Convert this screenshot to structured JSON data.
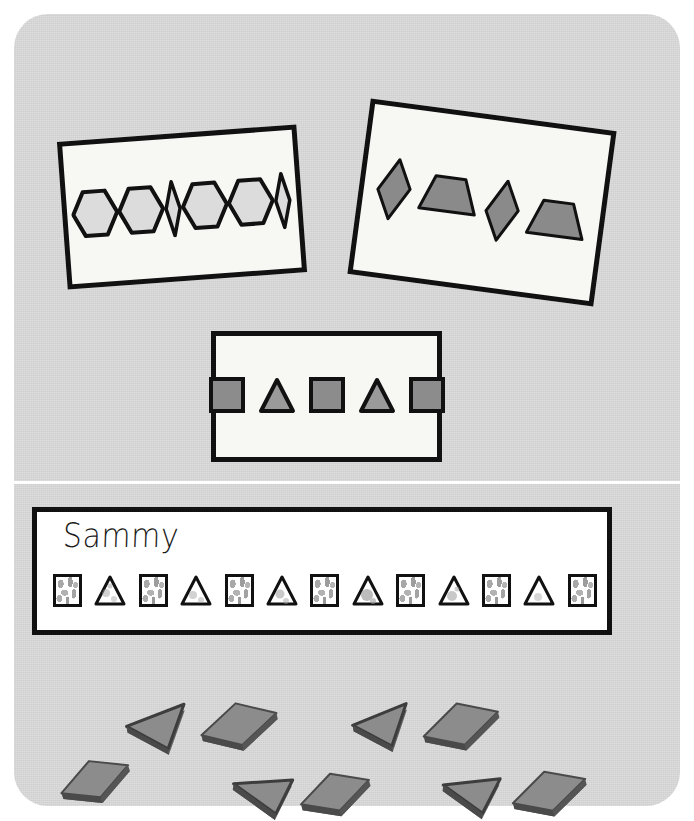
{
  "scene": {
    "title": "Pattern blocks worksheet scene",
    "board_color": "#d4d4d4",
    "card_fill": "#f7f7f4",
    "outline_color": "#111111",
    "block_fill": "#8c8c8c",
    "block_edge": "#5f5f5f"
  },
  "cards": [
    {
      "id": "card-hexagon-rhombus",
      "label": "Hexagon and slim rhombus pattern card",
      "rotation_deg": -4.2,
      "pattern_unit": "hexagon, hexagon, slim-rhombus",
      "shapes": [
        "hexagon",
        "hexagon",
        "slim-rhombus",
        "hexagon",
        "hexagon",
        "slim-rhombus"
      ],
      "shape_style": "outlined light grey"
    },
    {
      "id": "card-rhombus-trapezoid",
      "label": "Rhombus and trapezoid pattern card",
      "rotation_deg": 7.6,
      "pattern_unit": "rhombus, trapezoid",
      "shapes": [
        "rhombus",
        "trapezoid",
        "rhombus",
        "trapezoid"
      ],
      "shape_style": "solid grey fill"
    },
    {
      "id": "card-square-triangle",
      "label": "Square and triangle pattern card",
      "rotation_deg": 0,
      "pattern_unit": "square, triangle",
      "shapes": [
        "square",
        "triangle",
        "square",
        "triangle",
        "square"
      ],
      "shape_style": "solid grey fill"
    }
  ],
  "worksheet": {
    "name": "Sammy",
    "name_style": "handwritten",
    "pattern_unit": "square, triangle",
    "shapes": [
      "square",
      "triangle",
      "square",
      "triangle",
      "square",
      "triangle",
      "square",
      "triangle",
      "square",
      "triangle",
      "square",
      "triangle",
      "square"
    ],
    "shape_count": 13,
    "coloring": "crayon-mottled"
  },
  "loose_blocks": [
    {
      "shape": "square",
      "x": 56,
      "y": 752,
      "rotation_deg": -18,
      "size": 52
    },
    {
      "shape": "triangle",
      "x": 124,
      "y": 707,
      "rotation_deg": -14,
      "size": 48
    },
    {
      "shape": "square",
      "x": 200,
      "y": 698,
      "rotation_deg": -12,
      "size": 56
    },
    {
      "shape": "triangle",
      "x": 228,
      "y": 770,
      "rotation_deg": 12,
      "size": 48
    },
    {
      "shape": "square",
      "x": 296,
      "y": 765,
      "rotation_deg": -15,
      "size": 52
    },
    {
      "shape": "triangle",
      "x": 350,
      "y": 707,
      "rotation_deg": -16,
      "size": 46
    },
    {
      "shape": "square",
      "x": 420,
      "y": 698,
      "rotation_deg": -14,
      "size": 56
    },
    {
      "shape": "triangle",
      "x": 440,
      "y": 772,
      "rotation_deg": 10,
      "size": 46
    },
    {
      "shape": "square",
      "x": 510,
      "y": 768,
      "rotation_deg": -14,
      "size": 54
    }
  ],
  "icons": {
    "hexagon": "hexagon-icon",
    "rhombus": "rhombus-icon",
    "slim_rhombus": "slim-rhombus-icon",
    "trapezoid": "trapezoid-icon",
    "square": "square-icon",
    "triangle": "triangle-icon"
  }
}
